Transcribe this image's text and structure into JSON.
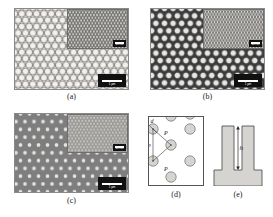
{
  "figure": {
    "kind": "sem-micrograph-figure",
    "panel_count": 5
  },
  "panels": [
    {
      "id": "a",
      "caption": "(a)",
      "type": "sem-micrograph",
      "description": "hexagonal close-packed bright nanopillar array, light background",
      "scalebar_label": "1 µm",
      "inset": {
        "present": true,
        "scalebar_label": "200 nm"
      }
    },
    {
      "id": "b",
      "caption": "(b)",
      "type": "sem-micrograph",
      "description": "hexagonal bright nanopillar array on dark background",
      "scalebar_label": "1 µm",
      "inset": {
        "present": true,
        "scalebar_label": "200 nm"
      }
    },
    {
      "id": "c",
      "caption": "(c)",
      "type": "sem-micrograph",
      "description": "small bright nanopillar dots on mid-grey background",
      "scalebar_label": "1 µm",
      "inset": {
        "present": true,
        "scalebar_label": "200 nm"
      }
    },
    {
      "id": "d",
      "caption": "(d)",
      "type": "schematic-top-view",
      "description": "top view schematic of hexagonal lattice showing pitch and diameter",
      "labels": {
        "diameter": "d",
        "pitch_1": "P",
        "pitch_2": "P",
        "pitch_3": "P"
      }
    },
    {
      "id": "e",
      "caption": "(e)",
      "type": "schematic-cross-section",
      "description": "cross-section schematic of two pillars on a substrate showing height",
      "labels": {
        "height": "h"
      }
    }
  ],
  "colors": {
    "panel_a_background": "#d8d6d2",
    "panel_b_background": "#3c3c3c",
    "panel_c_background": "#7e7e7e",
    "schematic_fill": "#d6d4d0",
    "schematic_stroke": "#555555",
    "scalebar_box": "#111111",
    "scalebar_bar": "#ffffff",
    "caption_text": "#1a1a1a"
  }
}
